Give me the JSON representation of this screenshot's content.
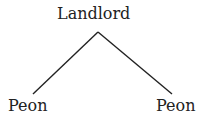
{
  "diagram": {
    "root": {
      "label": "Landlord"
    },
    "children": [
      {
        "label": "Peon"
      },
      {
        "label": "Peon"
      }
    ],
    "line_color": "#222222"
  }
}
